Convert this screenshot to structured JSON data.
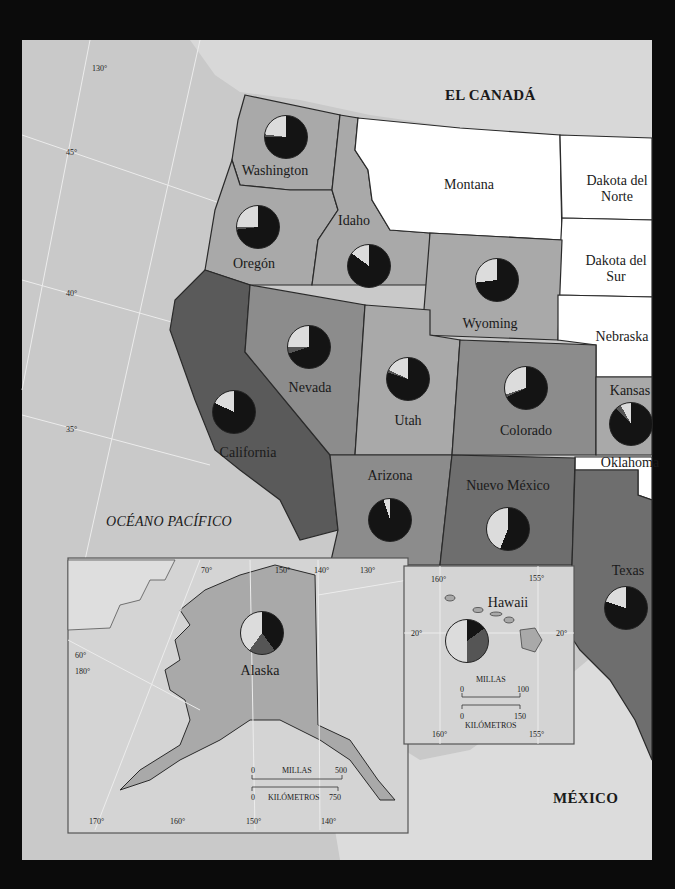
{
  "map": {
    "regions": {
      "canada": "EL CANADÁ",
      "mexico": "MÉXICO",
      "ocean": "OCÉANO PACÍFICO"
    },
    "states": [
      {
        "id": "washington",
        "label": "Washington",
        "x": 275,
        "y": 172,
        "pie": {
          "cx": 286,
          "cy": 137,
          "r": 22
        }
      },
      {
        "id": "oregon",
        "label": "Oregón",
        "x": 254,
        "y": 265,
        "pie": {
          "cx": 258,
          "cy": 227,
          "r": 22
        }
      },
      {
        "id": "idaho",
        "label": "Idaho",
        "x": 354,
        "y": 222,
        "pie": {
          "cx": 369,
          "cy": 266,
          "r": 22
        }
      },
      {
        "id": "montana",
        "label": "Montana",
        "x": 469,
        "y": 186
      },
      {
        "id": "dakota_norte",
        "label": "Dakota del\nNorte",
        "x": 617,
        "y": 182
      },
      {
        "id": "dakota_sur",
        "label": "Dakota del\nSur",
        "x": 616,
        "y": 262
      },
      {
        "id": "wyoming",
        "label": "Wyoming",
        "x": 490,
        "y": 325,
        "pie": {
          "cx": 497,
          "cy": 280,
          "r": 22
        }
      },
      {
        "id": "nebraska",
        "label": "Nebraska",
        "x": 622,
        "y": 338
      },
      {
        "id": "nevada",
        "label": "Nevada",
        "x": 310,
        "y": 389,
        "pie": {
          "cx": 309,
          "cy": 347,
          "r": 22
        }
      },
      {
        "id": "utah",
        "label": "Utah",
        "x": 408,
        "y": 422,
        "pie": {
          "cx": 408,
          "cy": 379,
          "r": 22
        }
      },
      {
        "id": "colorado",
        "label": "Colorado",
        "x": 526,
        "y": 432,
        "pie": {
          "cx": 526,
          "cy": 388,
          "r": 22
        }
      },
      {
        "id": "kansas",
        "label": "Kansas",
        "x": 630,
        "y": 392,
        "pie": {
          "cx": 631,
          "cy": 424,
          "r": 22
        }
      },
      {
        "id": "california",
        "label": "California",
        "x": 248,
        "y": 454,
        "pie": {
          "cx": 234,
          "cy": 412,
          "r": 22
        }
      },
      {
        "id": "oklahoma",
        "label": "Oklahoma",
        "x": 630,
        "y": 464
      },
      {
        "id": "arizona",
        "label": "Arizona",
        "x": 390,
        "y": 477,
        "pie": {
          "cx": 390,
          "cy": 520,
          "r": 22
        }
      },
      {
        "id": "nuevo_mexico",
        "label": "Nuevo México",
        "x": 508,
        "y": 487,
        "pie": {
          "cx": 508,
          "cy": 529,
          "r": 22
        }
      },
      {
        "id": "texas",
        "label": "Texas",
        "x": 628,
        "y": 572,
        "pie": {
          "cx": 626,
          "cy": 608,
          "r": 22
        }
      },
      {
        "id": "alaska",
        "label": "Alaska",
        "x": 260,
        "y": 672,
        "pie": {
          "cx": 262,
          "cy": 633,
          "r": 22
        }
      },
      {
        "id": "hawaii",
        "label": "Hawaii",
        "x": 508,
        "y": 604,
        "pie": {
          "cx": 467,
          "cy": 641,
          "r": 22
        }
      }
    ],
    "graticule": {
      "main": [
        "130°",
        "45°",
        "40°",
        "35°"
      ],
      "alaska": [
        "70°",
        "150°",
        "140°",
        "130°",
        "60°",
        "180°",
        "170°",
        "160°",
        "150°",
        "140°"
      ],
      "hawaii": [
        "160°",
        "155°",
        "20°",
        "20°",
        "160°",
        "155°"
      ]
    },
    "scales": {
      "alaska": {
        "miles_label": "MILLAS",
        "miles_0": "0",
        "miles_max": "500",
        "km_label": "KILÓMETROS",
        "km_0": "0",
        "km_max": "750"
      },
      "hawaii": {
        "miles_label": "MILLAS",
        "miles_0": "0",
        "miles_max": "100",
        "km_label": "KILÓMETROS",
        "km_0": "0",
        "km_max": "150"
      }
    },
    "colors": {
      "frame": "#0b0b0b",
      "ocean": "#c9c9c9",
      "foreign": "#d8d8d8",
      "white_state": "#ffffff",
      "light_state": "#a9a9a9",
      "mid_state": "#8c8c8c",
      "dark_state": "#6e6e6e",
      "darkest_state": "#5a5a5a",
      "pie_black": "#141414",
      "pie_dark": "#555555",
      "pie_light": "#dcdcdc"
    }
  },
  "chart_data": {
    "type": "pie",
    "title": "",
    "segment_order": [
      "black",
      "dark_gray",
      "light_gray"
    ],
    "note": "Pie charts per state; segment meanings not labeled in view. Percentages estimated visually, clockwise from 12 o'clock.",
    "series": [
      {
        "name": "Washington",
        "values": [
          75,
          2,
          23
        ]
      },
      {
        "name": "Oregón",
        "values": [
          73,
          2,
          25
        ]
      },
      {
        "name": "Idaho",
        "values": [
          85,
          0,
          15
        ]
      },
      {
        "name": "Wyoming",
        "values": [
          73,
          0,
          27
        ]
      },
      {
        "name": "California",
        "values": [
          82,
          0,
          18
        ]
      },
      {
        "name": "Nevada",
        "values": [
          70,
          5,
          25
        ]
      },
      {
        "name": "Utah",
        "values": [
          80,
          2,
          18
        ]
      },
      {
        "name": "Colorado",
        "values": [
          68,
          2,
          30
        ]
      },
      {
        "name": "Kansas",
        "values": [
          88,
          4,
          8
        ]
      },
      {
        "name": "Arizona",
        "values": [
          95,
          0,
          5
        ]
      },
      {
        "name": "Nuevo México",
        "values": [
          56,
          0,
          44
        ]
      },
      {
        "name": "Texas",
        "values": [
          80,
          0,
          20
        ]
      },
      {
        "name": "Alaska",
        "values": [
          40,
          20,
          40
        ]
      },
      {
        "name": "Hawaii",
        "values": [
          15,
          35,
          50
        ]
      }
    ]
  }
}
